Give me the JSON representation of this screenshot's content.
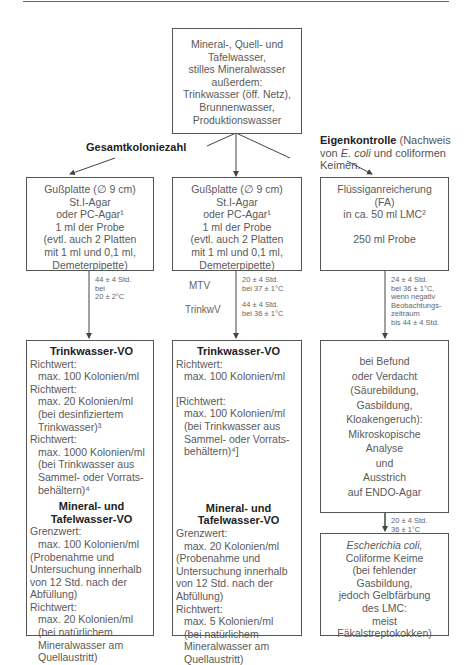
{
  "top_box": {
    "lines": [
      "Mineral-, Quell- und",
      "Tafelwasser,",
      "stilles Mineralwasser",
      "außerdem:",
      "Trinkwasser (öff. Netz),",
      "Brunnenwasser,",
      "Produktionswasser"
    ]
  },
  "labels": {
    "gesamtkoloniezahl": "Gesamtkoloniezahl",
    "eigenkontrolle_bold": "Eigenkontrolle",
    "eigenkontrolle_rest_1": " (Nachweis",
    "eigenkontrolle_line2_pre": "von ",
    "eigenkontrolle_line2_italic": "E. coli",
    "eigenkontrolle_line2_post": " und coliformen",
    "eigenkontrolle_line3": "Keimen."
  },
  "left_plate_box": {
    "lines": [
      "Gußplatte (∅ 9 cm)",
      "St.I-Agar",
      "oder PC-Agar¹",
      "1 ml der Probe",
      "(evtl. auch 2 Platten",
      "mit 1 ml und 0,1 ml,",
      "Demeterpipette)"
    ]
  },
  "middle_plate_box": {
    "lines": [
      "Gußplatte (∅ 9 cm)",
      "St.I-Agar",
      "oder PC-Agar¹",
      "1 ml der Probe",
      "(evtl. auch 2 Platten",
      "mit 1 ml und 0,1 ml,",
      "Demeterpipette)"
    ]
  },
  "right_fa_box": {
    "lines": [
      "Flüssiganreicherung",
      "(FA)",
      "in ca. 50 ml LMC²"
    ],
    "sample": "250 ml Probe"
  },
  "conditions": {
    "left": [
      "44 ± 4 Std.",
      "bei",
      "20 ± 2°C"
    ],
    "middle_mtv_label": "MTV",
    "middle_mtv": [
      "20 ± 4 Std.",
      "bei 37 ± 1°C"
    ],
    "middle_trinkwv_label": "TrinkwV",
    "middle_trinkwv": [
      "44 ± 4 Std.",
      "bei 36 ± 1°C"
    ],
    "right_top": [
      "24 ± 4 Std.",
      "bei 36 ± 1°C,",
      "wenn negativ",
      "Beobachtungs-",
      "zeitraum",
      "bis 44 ± 4 Std."
    ],
    "right_bottom": [
      "20 ± 4 Std.",
      "36 ± 1°C"
    ]
  },
  "left_result_box": {
    "heading1": "Trinkwasser-VO",
    "section1": [
      {
        "text": "Richtwert:",
        "indent": false
      },
      {
        "text": "max. 100 Kolonien/ml",
        "indent": true
      },
      {
        "text": "Richtwert:",
        "indent": false
      },
      {
        "text": "max. 20 Kolonien/ml",
        "indent": true
      },
      {
        "text": "(bei desinfiziertem",
        "indent": true
      },
      {
        "text": "Trinkwasser)³",
        "indent": true
      },
      {
        "text": "Richtwert:",
        "indent": false
      },
      {
        "text": "max. 1000 Kolonien/ml",
        "indent": true
      },
      {
        "text": "(bei Trinkwasser aus",
        "indent": true
      },
      {
        "text": "Sammel- oder Vorrats-",
        "indent": true
      },
      {
        "text": "behältern)⁴",
        "indent": true
      }
    ],
    "heading2a": "Mineral- und",
    "heading2b": "Tafelwasser-VO",
    "section2": [
      {
        "text": "Grenzwert:",
        "indent": false
      },
      {
        "text": "max. 100 Kolonien/ml",
        "indent": true
      },
      {
        "text": "(Probenahme und",
        "indent": false
      },
      {
        "text": "Untersuchung innerhalb",
        "indent": false
      },
      {
        "text": "von 12 Std. nach der",
        "indent": false
      },
      {
        "text": "Abfüllung)",
        "indent": false
      },
      {
        "text": "Richtwert:",
        "indent": false
      },
      {
        "text": "max. 20 Kolonien/ml",
        "indent": true
      },
      {
        "text": "(bei natürlichem",
        "indent": true
      },
      {
        "text": "Mineralwasser am",
        "indent": true
      },
      {
        "text": "Quellaustritt)",
        "indent": true
      }
    ]
  },
  "middle_result_box": {
    "heading1": "Trinkwasser-VO",
    "section1a": [
      {
        "text": "Richtwert:",
        "indent": false
      },
      {
        "text": "max. 100 Kolonien/ml",
        "indent": true
      }
    ],
    "section1b": [
      {
        "text": "[Richtwert:",
        "indent": false
      },
      {
        "text": "max. 100 Kolonien/ml",
        "indent": true
      },
      {
        "text": "(bei Trinkwasser aus",
        "indent": true
      },
      {
        "text": "Sammel- oder Vorrats-",
        "indent": true
      },
      {
        "text": "behältern)⁴]",
        "indent": true
      }
    ],
    "heading2a": "Mineral- und",
    "heading2b": "Tafelwasser-VO",
    "section2": [
      {
        "text": "Grenzwert:",
        "indent": false
      },
      {
        "text": "max. 20 Kolonien/ml",
        "indent": true
      },
      {
        "text": "(Probenahme und",
        "indent": false
      },
      {
        "text": "Untersuchung innerhalb",
        "indent": false
      },
      {
        "text": "von 12 Std. nach der",
        "indent": false
      },
      {
        "text": "Abfüllung)",
        "indent": false
      },
      {
        "text": "Richtwert:",
        "indent": false
      },
      {
        "text": "max. 5 Kolonien/ml",
        "indent": true
      },
      {
        "text": "(bei natürlichem",
        "indent": true
      },
      {
        "text": "Mineralwasser am",
        "indent": true
      },
      {
        "text": "Quellaustritt)",
        "indent": true
      }
    ]
  },
  "right_analysis_box": {
    "lines": [
      "bei Befund",
      "oder Verdacht",
      "(Säurebildung,",
      "Gasbildung,",
      "Kloakengeruch):",
      "Mikroskopische",
      "Analyse",
      "und",
      "Ausstrich",
      "auf ENDO-Agar"
    ]
  },
  "right_result_box": {
    "italic_line": "Escherichia coli,",
    "lines": [
      "Coliforme Keime",
      "(bei fehlender",
      "Gasbildung,",
      "jedoch Gelbfärbung",
      "des LMC:",
      "meist",
      "Fäkalstreptokokken)"
    ]
  },
  "colors": {
    "line": "#555555",
    "text": "#5a5a5a",
    "heading": "#222222"
  }
}
